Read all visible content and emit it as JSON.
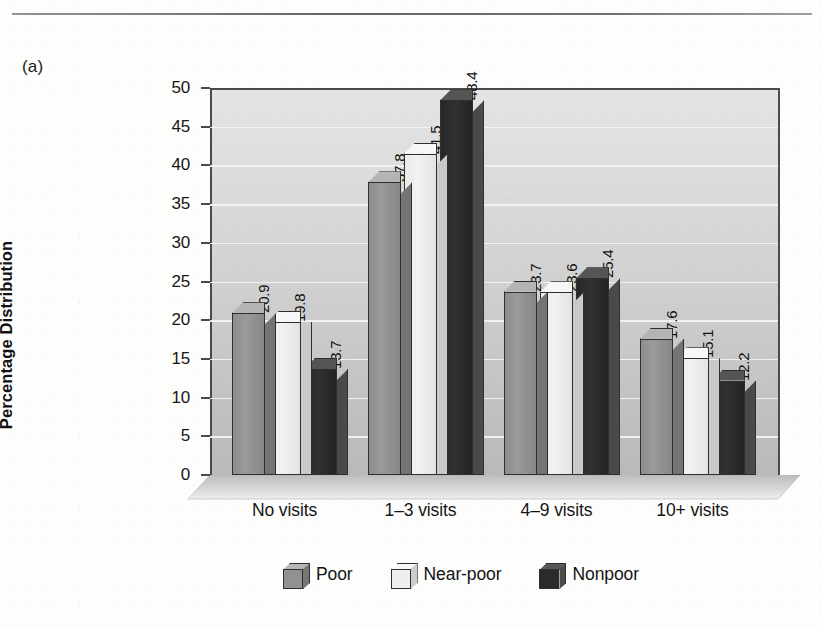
{
  "panel_label": "(a)",
  "divider": "horizontal-rule",
  "chart_data": {
    "type": "bar",
    "title": "",
    "subtitle": "",
    "xlabel": "",
    "ylabel": "Percentage Distribution",
    "ylim": [
      0,
      50
    ],
    "ytick_step": 5,
    "yticks": [
      0,
      5,
      10,
      15,
      20,
      25,
      30,
      35,
      40,
      45,
      50
    ],
    "ytick_labels": [
      "0",
      "5",
      "10",
      "15",
      "20",
      "25",
      "30",
      "35",
      "40",
      "45",
      "50"
    ],
    "grid": true,
    "grid_axis": "y",
    "grid_color": "#f4f4f4",
    "legend_position": "bottom-center",
    "style": "3d-clustered-column",
    "categories": [
      "No visits",
      "1–3 visits",
      "4–9 visits",
      "10+ visits"
    ],
    "series": [
      {
        "name": "Poor",
        "color": "#919191",
        "values": [
          20.9,
          37.8,
          23.7,
          17.6
        ],
        "labels": [
          "20.9",
          "37.8",
          "23.7",
          "17.6"
        ]
      },
      {
        "name": "Near-poor",
        "color": "#efefef",
        "values": [
          19.8,
          41.5,
          23.6,
          15.1
        ],
        "labels": [
          "19.8",
          "41.5",
          "23.6",
          "15.1"
        ]
      },
      {
        "name": "Nonpoor",
        "color": "#2a2a2a",
        "values": [
          13.7,
          48.4,
          25.4,
          12.2
        ],
        "labels": [
          "13.7",
          "48.4",
          "25.4",
          "12.2"
        ]
      }
    ]
  },
  "legend": {
    "items": [
      {
        "label": "Poor",
        "swatch": "poor-swatch-icon"
      },
      {
        "label": "Near-poor",
        "swatch": "near-poor-swatch-icon"
      },
      {
        "label": "Nonpoor",
        "swatch": "nonpoor-swatch-icon"
      }
    ]
  },
  "colors": {
    "plot_background_top": "#e4e4e4",
    "plot_background_bottom": "#b9b9b9",
    "axis": "#4b4b4b",
    "gridline": "#f4f4f4",
    "text": "#141414",
    "page_background": "#fdfdfc"
  }
}
